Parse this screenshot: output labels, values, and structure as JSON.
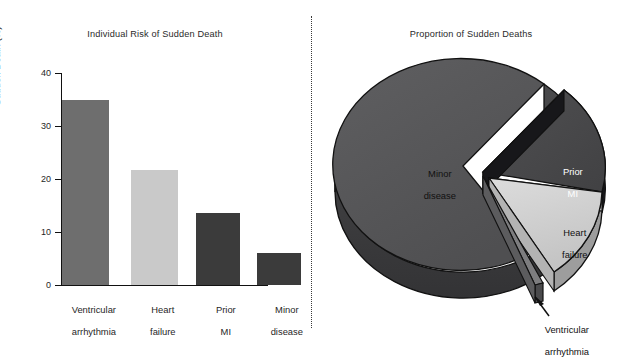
{
  "figure": {
    "divider": "dotted-vertical-rule"
  },
  "bar_panel": {
    "title": "Individual Risk of Sudden Death",
    "y_axis_label": "Sudden Death (%)",
    "y_ticks": [
      "0",
      "10",
      "20",
      "30",
      "40"
    ],
    "categories": [
      {
        "line1": "Ventricular",
        "line2": "arrhythmia"
      },
      {
        "line1": "Heart",
        "line2": "failure"
      },
      {
        "line1": "Prior",
        "line2": "MI"
      },
      {
        "line1": "Minor",
        "line2": "disease"
      }
    ]
  },
  "pie_panel": {
    "title": "Proportion of Sudden Deaths",
    "labels": {
      "minor_disease_l1": "Minor",
      "minor_disease_l2": "disease",
      "prior_mi_l1": "Prior",
      "prior_mi_l2": "MI",
      "heart_failure_l1": "Heart",
      "heart_failure_l2": "failure",
      "ventricular_l1": "Ventricular",
      "ventricular_l2": "arrhythmia"
    }
  },
  "colors": {
    "ventricular": "#6e6e6e",
    "heart_failure": "#c9c9c9",
    "prior_mi": "#3b3b3b",
    "minor_disease": "#3b3b3b",
    "pie_minor": "#58585a",
    "pie_minor_side": "#3c3c3e",
    "pie_prior_mi": "#4a4a4c",
    "pie_prior_mi_side": "#1c1c1e",
    "pie_heart_failure": "#d2d2d2",
    "pie_heart_failure_side": "#9a9a9a",
    "pie_ventricular": "#8a8a8c",
    "outline": "#111111",
    "axis": "#111111",
    "background": "#ffffff"
  },
  "chart_data": [
    {
      "type": "bar",
      "title": "Individual Risk of Sudden Death",
      "xlabel": "",
      "ylabel": "Sudden Death (%)",
      "ylim": [
        0,
        40
      ],
      "yticks": [
        0,
        10,
        20,
        30,
        40
      ],
      "grid": false,
      "legend": "none",
      "categories": [
        "Ventricular arrhythmia",
        "Heart failure",
        "Prior MI",
        "Minor disease"
      ],
      "values": [
        35,
        21.8,
        13.5,
        6
      ],
      "bar_colors": [
        "#6e6e6e",
        "#c9c9c9",
        "#3b3b3b",
        "#3b3b3b"
      ]
    },
    {
      "type": "pie",
      "title": "Proportion of Sudden Deaths",
      "style": "3d-exploded",
      "labels": [
        "Minor disease",
        "Prior MI",
        "Heart failure",
        "Ventricular arrhythmia"
      ],
      "values": [
        62,
        25,
        12,
        1
      ],
      "exploded": [
        false,
        true,
        true,
        true
      ],
      "slice_colors": [
        "#58585a",
        "#4a4a4c",
        "#d2d2d2",
        "#8a8a8c"
      ],
      "annotations": [
        {
          "text": "Ventricular arrhythmia",
          "target": "thin sliver at lower right",
          "arrow": true
        }
      ]
    }
  ]
}
